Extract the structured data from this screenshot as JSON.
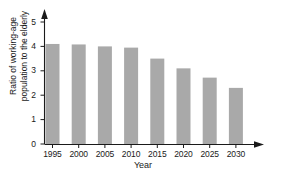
{
  "chart_data": {
    "type": "bar",
    "title": "",
    "xlabel": "Year",
    "ylabel": "Ratio of working-age population to the elderly",
    "ylabel_line1": "Ratio of working-age",
    "ylabel_line2": "population to the elderly",
    "categories": [
      "1995",
      "2000",
      "2005",
      "2010",
      "2015",
      "2020",
      "2025",
      "2030"
    ],
    "values": [
      4.1,
      4.08,
      4.0,
      3.95,
      3.5,
      3.1,
      2.72,
      2.3
    ],
    "ylim": [
      0,
      5
    ],
    "yticks": [
      "0",
      "1",
      "2",
      "3",
      "4",
      "5"
    ],
    "ytick_values": [
      0,
      1,
      2,
      3,
      4,
      5
    ],
    "grid": false,
    "legend": "none",
    "bar_color": "#a9a9a9",
    "axis_color": "#1a1a1a",
    "background": "#ffffff"
  }
}
